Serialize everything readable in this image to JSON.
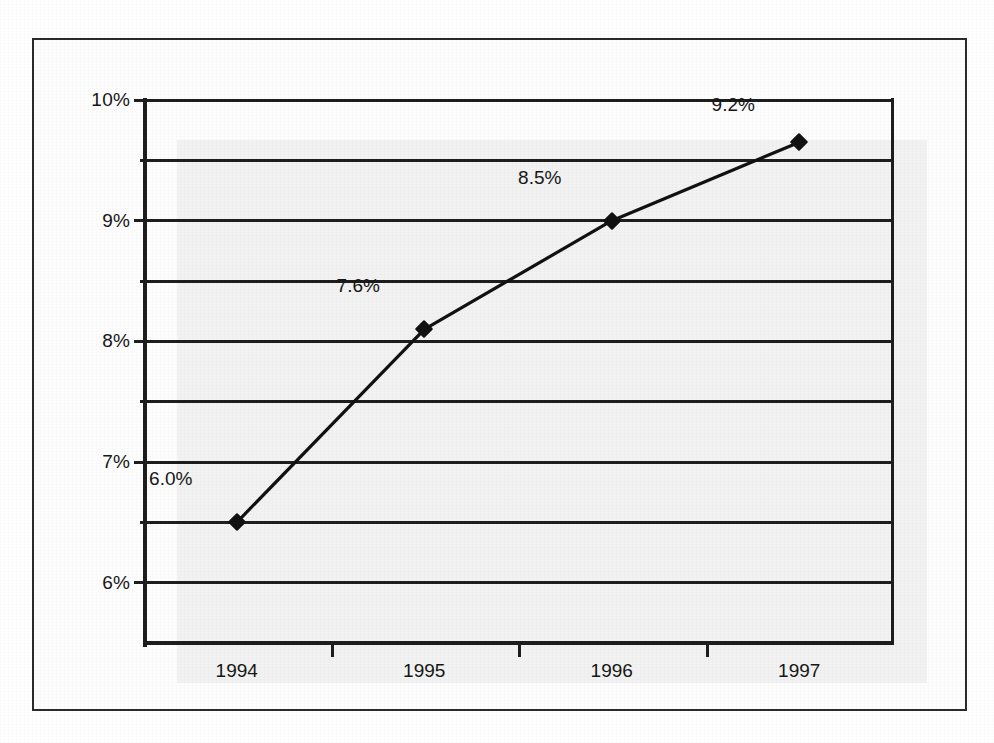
{
  "chart_data": {
    "type": "line",
    "title": "",
    "subtitle": "",
    "xlabel": "",
    "ylabel": "",
    "categories": [
      "1994",
      "1995",
      "1996",
      "1997"
    ],
    "series": [
      {
        "name": "",
        "values": [
          6.5,
          8.1,
          9.0,
          9.65
        ],
        "point_labels": [
          "6.0%",
          "7.6%",
          "8.5%",
          "9.2%"
        ]
      }
    ],
    "ylim": [
      5.5,
      10.0
    ],
    "ytick_values": [
      6,
      7,
      8,
      9,
      10
    ],
    "ytick_labels": [
      "6%",
      "7%",
      "8%",
      "9%",
      "10%"
    ],
    "gridline_values": [
      6.0,
      6.5,
      7.0,
      7.5,
      8.0,
      8.5,
      9.0,
      9.5,
      10.0
    ],
    "grid": true,
    "legend": "none",
    "marker": "diamond",
    "line_color": "#111111",
    "marker_color": "#111111",
    "plot_background": "#f2f2f2"
  },
  "caption": {
    "text": ""
  }
}
